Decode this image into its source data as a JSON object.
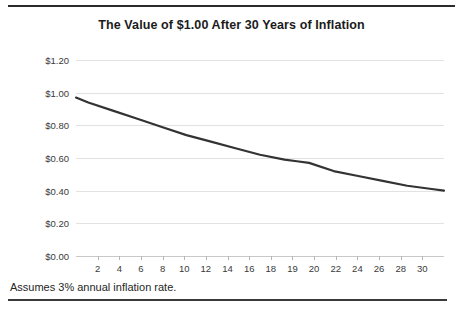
{
  "chart_data": {
    "type": "line",
    "title": "The Value of $1.00 After 30 Years of Inflation",
    "xlabel": "",
    "ylabel": "",
    "ylim": [
      0,
      1.2
    ],
    "xlim": [
      1,
      31
    ],
    "grid": true,
    "legend": false,
    "y_ticks": [
      "$0.00",
      "$0.20",
      "$0.40",
      "$0.60",
      "$0.80",
      "$1.00",
      "$1.20"
    ],
    "y_tick_values": [
      0,
      0.2,
      0.4,
      0.6,
      0.8,
      1.0,
      1.2
    ],
    "x_tick_labels": [
      "2",
      "4",
      "6",
      "8",
      "10",
      "12",
      "14",
      "16",
      "18",
      "19",
      "20",
      "22",
      "24",
      "26",
      "28",
      "30"
    ],
    "series": [
      {
        "name": "Value of $1.00",
        "color": "#333333",
        "x": [
          1,
          2,
          4,
          6,
          8,
          10,
          12,
          14,
          16,
          18,
          19,
          20,
          22,
          24,
          26,
          28,
          30,
          31
        ],
        "values": [
          0.97,
          0.94,
          0.89,
          0.84,
          0.79,
          0.74,
          0.7,
          0.66,
          0.62,
          0.59,
          0.58,
          0.57,
          0.52,
          0.49,
          0.46,
          0.43,
          0.41,
          0.4
        ]
      }
    ],
    "annotations": [
      "Assumes 3% annual inflation rate."
    ]
  },
  "footer": {
    "note": "Assumes 3% annual inflation rate."
  }
}
